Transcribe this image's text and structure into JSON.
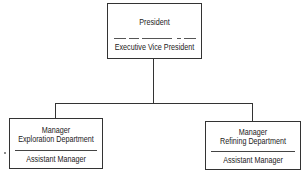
{
  "diagram": {
    "type": "organization-chart",
    "top": {
      "title": "President",
      "subtitle": "Executive Vice President"
    },
    "children": [
      {
        "title_line1": "Manager",
        "title_line2": "Exploration Department",
        "subtitle": "Assistant Manager"
      },
      {
        "title_line1": "Manager",
        "title_line2": "Refining Department",
        "subtitle": "Assistant Manager"
      }
    ],
    "colors": {
      "line": "#333333",
      "text": "#222222",
      "background": "#ffffff"
    }
  }
}
